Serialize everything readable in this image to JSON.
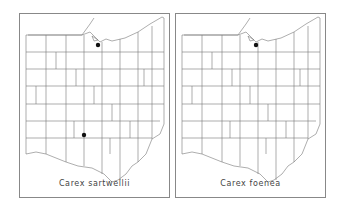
{
  "maps": [
    {
      "title": "Carex sartwellii",
      "region": "Ohio counties",
      "occurrences": [
        {
          "label": "northern record",
          "x": 78,
          "y": 31
        },
        {
          "label": "southern record",
          "x": 64,
          "y": 121
        }
      ]
    },
    {
      "title": "Carex foenea",
      "region": "Ohio counties",
      "occurrences": [
        {
          "label": "northern record",
          "x": 80,
          "y": 31
        }
      ]
    }
  ],
  "colors": {
    "line": "#777777",
    "dot": "#111111",
    "frame": "#888888"
  }
}
